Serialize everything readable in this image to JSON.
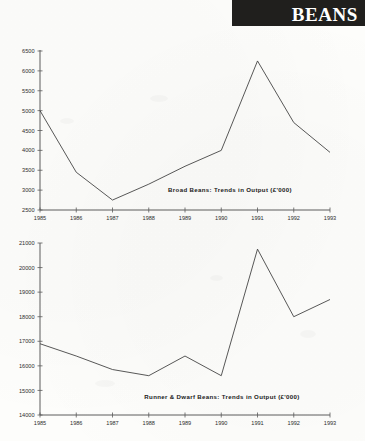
{
  "header": {
    "banner_title": "BEANS",
    "banner_color": "#201f1d",
    "banner_text_color": "#ffffff"
  },
  "charts": [
    {
      "id": "broad-beans",
      "caption": "Broad Beans: Trends in Output (£'000)"
    },
    {
      "id": "runner-dwarf-beans",
      "caption": "Runner & Dwarf Beans: Trends in Output (£'000)"
    }
  ],
  "chart_data": [
    {
      "type": "line",
      "title": "Broad Beans: Trends in Output (£'000)",
      "xlabel": "",
      "ylabel": "",
      "categories": [
        "1985",
        "1986",
        "1987",
        "1988",
        "1989",
        "1990",
        "1991",
        "1992",
        "1993"
      ],
      "values": [
        5000,
        3450,
        2750,
        3150,
        3600,
        4000,
        6250,
        4700,
        3950
      ],
      "ylim": [
        2500,
        6500
      ],
      "yticks": [
        2500,
        3000,
        3500,
        4000,
        4500,
        5000,
        5500,
        6000,
        6500
      ],
      "ytick_labels": [
        "2500",
        "3000",
        "3500",
        "4000",
        "4500",
        "5000",
        "5500",
        "6000",
        "6500"
      ],
      "grid": false,
      "legend": "none",
      "line_color": "#3a3a3a"
    },
    {
      "type": "line",
      "title": "Runner & Dwarf Beans: Trends in Output (£'000)",
      "xlabel": "",
      "ylabel": "",
      "categories": [
        "1985",
        "1986",
        "1987",
        "1988",
        "1989",
        "1990",
        "1991",
        "1992",
        "1993"
      ],
      "values": [
        16900,
        16400,
        15850,
        15600,
        16400,
        15600,
        20750,
        18000,
        18700
      ],
      "ylim": [
        14000,
        21000
      ],
      "yticks": [
        14000,
        15000,
        16000,
        17000,
        18000,
        19000,
        20000,
        21000
      ],
      "ytick_labels": [
        "14000",
        "15000",
        "16000",
        "17000",
        "18000",
        "19000",
        "20000",
        "21000"
      ],
      "grid": false,
      "legend": "none",
      "line_color": "#3a3a3a"
    }
  ]
}
